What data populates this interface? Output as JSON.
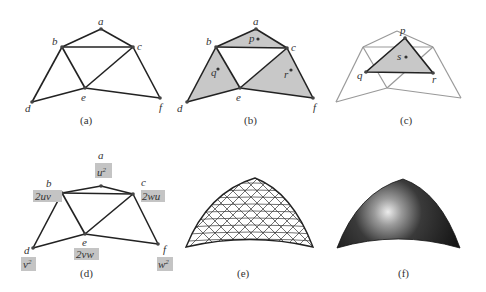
{
  "figure": {
    "panels": [
      {
        "id": "a",
        "caption": "(a)",
        "vertex_labels": {
          "a": "a",
          "b": "b",
          "c": "c",
          "d": "d",
          "e": "e",
          "f": "f"
        }
      },
      {
        "id": "b",
        "caption": "(b)",
        "vertex_labels": {
          "a": "a",
          "b": "b",
          "c": "c",
          "d": "d",
          "e": "e",
          "f": "f"
        },
        "face_points": {
          "p": "p",
          "q": "q",
          "r": "r"
        }
      },
      {
        "id": "c",
        "caption": "(c)",
        "vertex_labels": {
          "p": "p",
          "q": "q",
          "r": "r"
        },
        "face_points": {
          "s": "s"
        }
      },
      {
        "id": "d",
        "caption": "(d)",
        "vertex_labels": {
          "a": "a",
          "b": "b",
          "c": "c",
          "d": "d",
          "e": "e",
          "f": "f"
        },
        "weights": {
          "a": {
            "base": "u",
            "sup": "2"
          },
          "b": {
            "text": "2uv"
          },
          "c": {
            "text": "2wu"
          },
          "e": {
            "text": "2vw"
          },
          "d": {
            "base": "v",
            "sup": "2"
          },
          "f": {
            "base": "w",
            "sup": "2"
          }
        }
      },
      {
        "id": "e",
        "caption": "(e)"
      },
      {
        "id": "f",
        "caption": "(f)"
      }
    ],
    "colors": {
      "line": "#222222",
      "light_line": "#999999",
      "fill": "#c8c8c8",
      "label_box": "#c4c4c4",
      "surface_dark": "#1a1a1a",
      "highlight": "#e6e6e6"
    }
  }
}
